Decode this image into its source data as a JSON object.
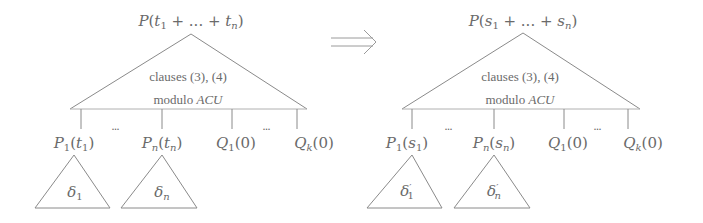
{
  "left_tree": {
    "root": "P(t1 + ... + tn)",
    "root_parts": {
      "pred": "P",
      "t1": "t",
      "s1": "1",
      "plus1": " + ... + ",
      "tn": "t",
      "sn": "n"
    },
    "body_line1": "clauses (3), (4)",
    "body_line2_prefix": "modulo ",
    "body_line2_math": "ACU",
    "children": [
      {
        "pred": "P",
        "pred_sub": "1",
        "arg": "t",
        "arg_sub": "1",
        "label": "P1(t1)"
      },
      {
        "pred": "P",
        "pred_sub": "n",
        "arg": "t",
        "arg_sub": "n",
        "label": "Pn(tn)"
      },
      {
        "pred": "Q",
        "pred_sub": "1",
        "arg": "0",
        "label": "Q1(0)"
      },
      {
        "pred": "Q",
        "pred_sub": "k",
        "arg": "0",
        "label": "Qk(0)"
      }
    ],
    "ellipsis": "...",
    "subtrees": [
      {
        "sym": "δ",
        "sub": "1",
        "prime": "",
        "label": "δ1"
      },
      {
        "sym": "δ",
        "sub": "n",
        "prime": "",
        "label": "δn"
      }
    ]
  },
  "arrow": {
    "symbol": "⟹",
    "meaning": "implies/transforms-to"
  },
  "right_tree": {
    "root": "P(s1 + ... + sn)",
    "root_parts": {
      "pred": "P",
      "t1": "s",
      "s1": "1",
      "plus1": " + ... + ",
      "tn": "s",
      "sn": "n"
    },
    "body_line1": "clauses (3), (4)",
    "body_line2_prefix": "modulo ",
    "body_line2_math": "ACU",
    "children": [
      {
        "pred": "P",
        "pred_sub": "1",
        "arg": "s",
        "arg_sub": "1",
        "label": "P1(s1)"
      },
      {
        "pred": "P",
        "pred_sub": "n",
        "arg": "s",
        "arg_sub": "n",
        "label": "Pn(sn)"
      },
      {
        "pred": "Q",
        "pred_sub": "1",
        "arg": "0",
        "label": "Q1(0)"
      },
      {
        "pred": "Q",
        "pred_sub": "k",
        "arg": "0",
        "label": "Qk(0)"
      }
    ],
    "ellipsis": "...",
    "subtrees": [
      {
        "sym": "δ",
        "sub": "1",
        "prime": "′",
        "label": "δ'1"
      },
      {
        "sym": "δ",
        "sub": "n",
        "prime": "′",
        "label": "δ'n"
      }
    ]
  },
  "colors": {
    "stroke": "#8a8a8a",
    "text": "#6a6a6a",
    "background": "#ffffff"
  }
}
